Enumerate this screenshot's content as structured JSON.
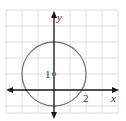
{
  "diagram": {
    "type": "coordinate-plane-circle",
    "axes": {
      "x_label": "x",
      "y_label": "y"
    },
    "tick_labels": {
      "x_tick": "2",
      "y_tick": "1"
    },
    "circle": {
      "center": [
        0,
        1
      ],
      "radius": 2,
      "color": "#7a7a7a"
    },
    "grid": {
      "x_range": [
        -3,
        4
      ],
      "y_range": [
        -1.4,
        5
      ],
      "spacing": 1,
      "color": "#d9d9d9"
    },
    "colors": {
      "axis": "#1a1a1a",
      "background": "#ffffff"
    }
  }
}
